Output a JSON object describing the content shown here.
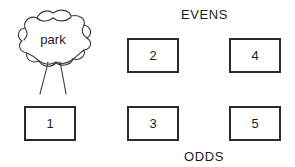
{
  "scene": {
    "width": 295,
    "height": 167,
    "background_color": "#ffffff",
    "stroke_color": "#2b2b2b",
    "text_color": "#1c1c1c"
  },
  "labels": {
    "evens": "EVENS",
    "odds": "ODDS"
  },
  "park": {
    "label": "park",
    "icon": "tree-icon"
  },
  "street": {
    "evens_side": [
      {
        "number": "2"
      },
      {
        "number": "4"
      }
    ],
    "odds_side": [
      {
        "number": "1"
      },
      {
        "number": "3"
      },
      {
        "number": "5"
      }
    ]
  }
}
